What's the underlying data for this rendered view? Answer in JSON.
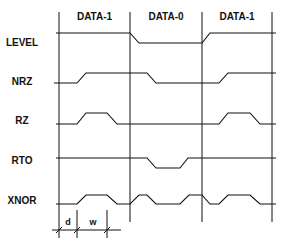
{
  "diagram": {
    "type": "timing-diagram",
    "columns": [
      "DATA-1",
      "DATA-0",
      "DATA-1"
    ],
    "signals": [
      {
        "name": "LEVEL"
      },
      {
        "name": "NRZ"
      },
      {
        "name": "RZ"
      },
      {
        "name": "RTO"
      },
      {
        "name": "XNOR"
      }
    ],
    "markers": {
      "d": "d",
      "w": "w"
    }
  }
}
